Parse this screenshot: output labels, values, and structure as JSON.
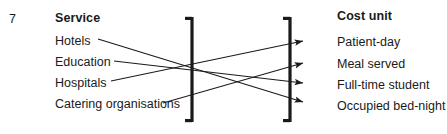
{
  "figure": {
    "number": "7",
    "left_heading": "Service",
    "right_heading": "Cost unit",
    "ink_color": "#1a1a1a",
    "background": "#ffffff"
  },
  "services": [
    {
      "label": "Hotels",
      "x": 55,
      "y": 41
    },
    {
      "label": "Education",
      "x": 55,
      "y": 63
    },
    {
      "label": "Hospitals",
      "x": 55,
      "y": 83
    },
    {
      "label": "Catering organisations",
      "x": 55,
      "y": 105
    }
  ],
  "cost_units": [
    {
      "label": "Patient-day",
      "x": 337,
      "y": 42
    },
    {
      "label": "Meal served",
      "x": 337,
      "y": 64
    },
    {
      "label": "Full-time student",
      "x": 337,
      "y": 85
    },
    {
      "label": "Occupied bed-night",
      "x": 337,
      "y": 106
    }
  ],
  "brackets": [
    {
      "name": "left-bracket",
      "x": 192,
      "top": 17,
      "bottom": 122,
      "serif": "left"
    },
    {
      "name": "right-bracket",
      "x": 290,
      "top": 17,
      "bottom": 122,
      "serif": "left"
    }
  ],
  "connections": [
    {
      "from": "Hotels",
      "to": "Occupied bed-night",
      "x1": 98,
      "y1": 39,
      "x2": 303,
      "y2": 102
    },
    {
      "from": "Education",
      "to": "Full-time student",
      "x1": 114,
      "y1": 61,
      "x2": 303,
      "y2": 83
    },
    {
      "from": "Hospitals",
      "to": "Patient-day",
      "x1": 111,
      "y1": 81,
      "x2": 303,
      "y2": 41
    },
    {
      "from": "Catering organisations",
      "to": "Meal served",
      "x1": 163,
      "y1": 103,
      "x2": 303,
      "y2": 63
    }
  ],
  "geometry": {
    "width": 447,
    "height": 134,
    "stroke_width": 1.1,
    "bracket_stroke": 3.2,
    "arrow_size": 9
  }
}
